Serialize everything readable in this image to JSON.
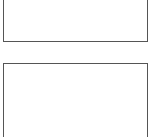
{
  "panels": [
    {
      "id": "top",
      "label": "",
      "border_color": "#555555"
    },
    {
      "id": "bottom",
      "label": "",
      "border_color": "#555555"
    }
  ]
}
